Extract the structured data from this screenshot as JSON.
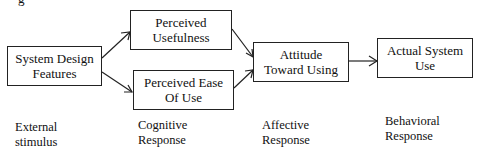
{
  "diagram": {
    "nodes": [
      {
        "id": "sdf",
        "label_line1": "System Design",
        "label_line2": "Features"
      },
      {
        "id": "pu",
        "label_line1": "Perceived",
        "label_line2": "Usefulness"
      },
      {
        "id": "peou",
        "label_line1": "Perceived Ease",
        "label_line2": "Of Use"
      },
      {
        "id": "att",
        "label_line1": "Attitude",
        "label_line2": "Toward Using"
      },
      {
        "id": "asu",
        "label_line1": "Actual System",
        "label_line2": "Use"
      }
    ],
    "edges": [
      {
        "from": "sdf",
        "to": "pu"
      },
      {
        "from": "sdf",
        "to": "peou"
      },
      {
        "from": "pu",
        "to": "att"
      },
      {
        "from": "peou",
        "to": "att"
      },
      {
        "from": "att",
        "to": "asu"
      }
    ],
    "stages": [
      {
        "line1": "External",
        "line2": "stimulus"
      },
      {
        "line1": "Cognitive",
        "line2": "Response"
      },
      {
        "line1": "Affective",
        "line2": "Response"
      },
      {
        "line1": "Behavioral",
        "line2": "Response"
      }
    ],
    "top_fragment": "g"
  }
}
